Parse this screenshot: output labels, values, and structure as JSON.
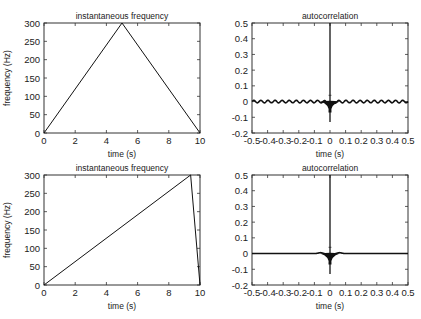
{
  "chart_data": [
    {
      "type": "line",
      "title": "instantaneous frequency",
      "xlabel": "time (s)",
      "ylabel": "frequency (Hz)",
      "xlim": [
        0,
        10
      ],
      "ylim": [
        0,
        300
      ],
      "xticks": [
        "0",
        "2",
        "4",
        "6",
        "8",
        "10"
      ],
      "yticks": [
        "0",
        "50",
        "100",
        "150",
        "200",
        "250",
        "300"
      ],
      "grid": false,
      "series": [
        {
          "name": "frequency",
          "x": [
            0,
            5,
            10
          ],
          "y": [
            0,
            300,
            0
          ]
        }
      ]
    },
    {
      "type": "line",
      "title": "autocorrelation",
      "xlabel": "time (s)",
      "ylabel": "",
      "xlim": [
        -0.5,
        0.5
      ],
      "ylim": [
        -0.2,
        0.5
      ],
      "xticks": [
        "-0.5",
        "-0.4",
        "-0.3",
        "-0.2",
        "-0.1",
        "0",
        "0.1",
        "0.2",
        "0.3",
        "0.4",
        "0.5"
      ],
      "yticks": [
        "-0.2",
        "-0.1",
        "0",
        "0.1",
        "0.2",
        "0.3",
        "0.4",
        "0.5"
      ],
      "grid": false,
      "series": [
        {
          "name": "autocorrelation",
          "x": [
            -0.5,
            -0.02,
            0,
            0.02,
            0.5
          ],
          "y": [
            0,
            -0.03,
            0.5,
            -0.03,
            0
          ],
          "notes": "peak 0.5 at 0, dip to about -0.13 near 0, small ripples ±0.01 across range"
        }
      ]
    },
    {
      "type": "line",
      "title": "instantaneous frequency",
      "xlabel": "time (s)",
      "ylabel": "frequency (Hz)",
      "xlim": [
        0,
        10
      ],
      "ylim": [
        0,
        300
      ],
      "xticks": [
        "0",
        "2",
        "4",
        "6",
        "8",
        "10"
      ],
      "yticks": [
        "0",
        "50",
        "100",
        "150",
        "200",
        "250",
        "300"
      ],
      "grid": false,
      "series": [
        {
          "name": "frequency",
          "x": [
            0,
            9.4,
            10
          ],
          "y": [
            0,
            300,
            0
          ]
        }
      ]
    },
    {
      "type": "line",
      "title": "autocorrelation",
      "xlabel": "time (s)",
      "ylabel": "",
      "xlim": [
        -0.5,
        0.5
      ],
      "ylim": [
        -0.2,
        0.5
      ],
      "xticks": [
        "-0.5",
        "-0.4",
        "-0.3",
        "-0.2",
        "-0.1",
        "0",
        "0.1",
        "0.2",
        "0.3",
        "0.4",
        "0.5"
      ],
      "yticks": [
        "-0.2",
        "-0.1",
        "0",
        "0.1",
        "0.2",
        "0.3",
        "0.4",
        "0.5"
      ],
      "grid": false,
      "series": [
        {
          "name": "autocorrelation",
          "x": [
            -0.5,
            -0.02,
            0,
            0.02,
            0.5
          ],
          "y": [
            0,
            -0.03,
            0.5,
            -0.03,
            0
          ],
          "notes": "peak 0.5 at 0, dip to about -0.13 near 0, flat elsewhere"
        }
      ]
    }
  ]
}
